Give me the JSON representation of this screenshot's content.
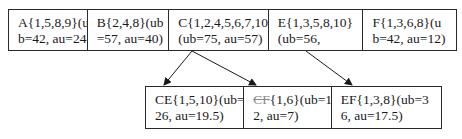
{
  "top_row": [
    {
      "id": "A",
      "line1": "A{1,5,8,9}(u",
      "line2": "b=42, au=24}",
      "width": 79
    },
    {
      "id": "B",
      "line1": "B{2,4,8}(ub",
      "line2": "=57, au=40)",
      "width": 82
    },
    {
      "id": "C",
      "line1": "C{1,2,4,5,6,7,10}",
      "line2": "(ub=75, au=57)",
      "width": 100
    },
    {
      "id": "E",
      "line1": "E{1,3,5,8,10}",
      "line2": "(ub=56,",
      "width": 95
    },
    {
      "id": "F",
      "line1": "F{1,3,6,8}(u",
      "line2": "b=42, au=12)",
      "width": 93
    }
  ],
  "bottom_row": [
    {
      "id": "CE",
      "name": "CE",
      "line1_rest": "{1,5,10}(ub=",
      "line2": "26, au=19.5)",
      "pruned": false,
      "width": 99
    },
    {
      "id": "CF",
      "name": "CF",
      "line1_rest": "{1,6}(ub=1",
      "line2": "2, au=7)",
      "pruned": true,
      "width": 88
    },
    {
      "id": "EF",
      "name": "EF",
      "line1_rest": "{1,3,8}(ub=3",
      "line2": "6, au=17.5)",
      "pruned": false,
      "width": 110
    }
  ],
  "edges": [
    {
      "from": "C",
      "to": "CE"
    },
    {
      "from": "C",
      "to": "CF"
    },
    {
      "from": "E",
      "to": "EF"
    }
  ],
  "colors": {
    "line": "#2a2a2a",
    "pruned_text": "#8a8a8a"
  }
}
